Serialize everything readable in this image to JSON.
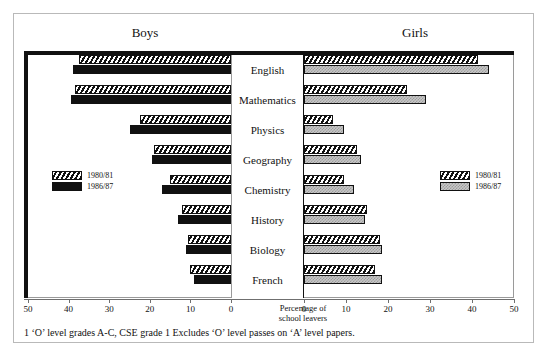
{
  "chart_data": {
    "type": "bar",
    "orientation": "horizontal",
    "style": "bidirectional population pyramid",
    "title": "",
    "categories": [
      "English",
      "Mathematics",
      "Physics",
      "Geography",
      "Chemistry",
      "History",
      "Biology",
      "French"
    ],
    "panels": [
      {
        "name": "Boys",
        "direction": "left",
        "axis_max": 50,
        "series": [
          {
            "name": "1980/81",
            "pattern": "diagonal-hatch",
            "values": [
              37.5,
              38.5,
              22.5,
              19,
              15,
              12,
              10.5,
              10
            ]
          },
          {
            "name": "1986/87",
            "pattern": "solid-black",
            "values": [
              39,
              39.5,
              25,
              19.5,
              17,
              13,
              11,
              9
            ]
          }
        ]
      },
      {
        "name": "Girls",
        "direction": "right",
        "axis_max": 50,
        "series": [
          {
            "name": "1980/81",
            "pattern": "diagonal-hatch",
            "values": [
              41.5,
              24.5,
              7,
              12.5,
              9.5,
              15,
              18,
              17
            ]
          },
          {
            "name": "1986/87",
            "pattern": "grey-check",
            "values": [
              44,
              29,
              9.5,
              13.5,
              12,
              14.5,
              18.5,
              18.5
            ]
          }
        ]
      }
    ],
    "xlabel": "Percentage of school leavers",
    "xticks": [
      50,
      40,
      30,
      20,
      10,
      0,
      0,
      10,
      20,
      30,
      40,
      50
    ],
    "grid": false,
    "legend_position": "inside-left-and-right"
  },
  "header": {
    "boys": "Boys",
    "girls": "Girls"
  },
  "axis": {
    "title_line1": "Percentage of",
    "title_line2": "school leavers",
    "left_ticks": [
      "50",
      "40",
      "30",
      "20",
      "10",
      "0"
    ],
    "right_ticks": [
      "0",
      "10",
      "20",
      "30",
      "40",
      "50"
    ]
  },
  "legend": {
    "boys": [
      {
        "label": "1980/81"
      },
      {
        "label": "1986/87"
      }
    ],
    "girls": [
      {
        "label": "1980/81"
      },
      {
        "label": "1986/87"
      }
    ]
  },
  "footnote": "1 ‘O’ level grades A-C, CSE grade 1 Excludes ‘O’ level passes on ‘A’ level papers."
}
